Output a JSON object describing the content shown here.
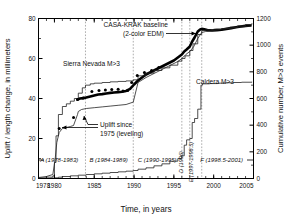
{
  "figure": {
    "xlabel": "Time, in years",
    "ylabel_left": "Uplift / length change, in millimeters",
    "ylabel_right": "Cumulative number, M>3 events"
  },
  "annotations": {
    "casa_krak_line1": "CASA-KRAK baseline",
    "casa_krak_line2": "(2-color EDM)",
    "sierra_nevada": "Sierra Nevada M>3",
    "caldera": "Caldera M>3",
    "uplift_line1": "Uplift since",
    "uplift_line2": "1975 (leveling)"
  },
  "periods": [
    {
      "id": "A",
      "label": "A (1978-1983)",
      "orient": "h",
      "x": 1980.6
    },
    {
      "id": "B",
      "label": "B (1984-1989)",
      "orient": "h",
      "x": 1986.8
    },
    {
      "id": "C",
      "label": "C (1990-1995)",
      "orient": "h",
      "x": 1992.9
    },
    {
      "id": "D",
      "label": "D (1996)",
      "orient": "v",
      "x": 1996.45
    },
    {
      "id": "E",
      "label": "E (1997-1998.5)",
      "orient": "v",
      "x": 1997.6
    },
    {
      "id": "F",
      "label": "F (1998.5-2001)",
      "orient": "h",
      "x": 2001.0
    }
  ],
  "chart_data": {
    "type": "line",
    "title": "",
    "xlabel": "Time, in years",
    "ylabel": "Uplift / length change, in millimeters",
    "ylabel_secondary": "Cumulative number, M>3 events",
    "xlim": [
      1978,
      2005
    ],
    "ylim": [
      0,
      80
    ],
    "ylim_secondary": [
      0,
      1200
    ],
    "xticks": [
      1978,
      1980,
      1985,
      1990,
      1995,
      2000,
      2005
    ],
    "xtick_labels": [
      "1978",
      "1980",
      "1985",
      "1990",
      "1995",
      "2000",
      "2005"
    ],
    "yticks": [
      0,
      20,
      40,
      60,
      80
    ],
    "ytick_labels": [
      "0",
      "20",
      "40",
      "60",
      "80"
    ],
    "yticks_secondary": [
      0,
      200,
      400,
      600,
      800,
      1000,
      1200
    ],
    "ytick_labels_secondary": [
      "0",
      "200",
      "400",
      "600",
      "800",
      "1000",
      "1200"
    ],
    "grid": false,
    "vertical_dashed_lines": [
      1983.9,
      1989.9,
      1996.0,
      1997.0,
      1998.5
    ],
    "legend_position": "inline-annotations",
    "series": [
      {
        "name": "CASA-KRAK baseline (2-color EDM)",
        "axis": "left",
        "style": "thick-black-line",
        "x": [
          1982.9,
          1983.2,
          1983.6,
          1984.0,
          1984.5,
          1985.0,
          1985.5,
          1986.0,
          1986.5,
          1987.0,
          1987.5,
          1988.0,
          1988.5,
          1989.0,
          1989.5,
          1990.0,
          1990.5,
          1991.0,
          1991.5,
          1992.0,
          1992.5,
          1993.0,
          1993.5,
          1994.0,
          1994.5,
          1995.0,
          1995.5,
          1996.0,
          1996.3,
          1996.6,
          1997.0,
          1997.3,
          1997.6,
          1998.0,
          1998.3,
          1998.5,
          1998.8,
          1999.2,
          1999.8,
          2000.4,
          2001.0,
          2001.6,
          2002.2,
          2002.8,
          2003.4,
          2004.0,
          2004.6
        ],
        "y": [
          39.5,
          40.0,
          40.2,
          40.5,
          41.0,
          41.5,
          42.0,
          42.2,
          42.5,
          42.8,
          43.0,
          43.2,
          43.4,
          43.8,
          44.8,
          47.0,
          49.0,
          50.5,
          52.0,
          53.0,
          54.0,
          55.0,
          56.0,
          57.0,
          58.0,
          59.0,
          60.5,
          62.0,
          63.5,
          64.5,
          66.0,
          68.5,
          70.5,
          73.5,
          74.5,
          74.8,
          74.6,
          74.2,
          74.0,
          74.2,
          74.4,
          74.8,
          75.2,
          75.6,
          76.0,
          76.3,
          76.5
        ]
      },
      {
        "name": "Uplift since 1975 (leveling)",
        "axis": "left",
        "style": "thin-black-line",
        "x": [
          1978.0,
          1979.0,
          1979.8,
          1980.1,
          1980.3,
          1980.6,
          1981.0,
          1981.5,
          1982.0,
          1982.4,
          1982.9,
          1983.0,
          1983.4,
          1984.0,
          1985.0,
          1986.0,
          1987.0,
          1988.0,
          1989.0,
          1989.9,
          1990.5,
          1991.5,
          1992.5,
          1993.5,
          1994.5,
          1995.5,
          1996.0,
          1996.5,
          1997.0,
          1997.5,
          1998.0,
          1998.5,
          1999.0,
          2000.0,
          2001.0,
          2002.0,
          2003.0,
          2004.0,
          2004.8
        ],
        "y": [
          0.5,
          1.0,
          2.0,
          10.0,
          18.0,
          23.0,
          25.0,
          25.5,
          26.0,
          26.5,
          32.0,
          33.5,
          34.5,
          35.0,
          35.4,
          35.8,
          36.2,
          36.6,
          37.0,
          38.2,
          48.0,
          50.5,
          52.5,
          54.5,
          56.5,
          58.5,
          60.0,
          62.0,
          63.5,
          66.0,
          70.0,
          73.0,
          73.5,
          74.0,
          74.6,
          75.0,
          75.6,
          76.0,
          76.3
        ]
      },
      {
        "name": "Sierra Nevada M>3",
        "axis": "right",
        "style": "thin-staircase",
        "x": [
          1978.0,
          1979.0,
          1979.8,
          1980.0,
          1980.2,
          1980.5,
          1981.0,
          1981.5,
          1982.0,
          1982.5,
          1983.0,
          1983.5,
          1983.9,
          1984.5,
          1985.0,
          1986.0,
          1987.0,
          1988.0,
          1989.0,
          1989.9,
          1990.5,
          1991.5,
          1992.5,
          1993.5,
          1994.5,
          1995.5,
          1996.0,
          1996.4,
          1997.0,
          1997.4,
          1998.0,
          1998.5,
          1999.0,
          2000.0,
          2001.0,
          2002.0,
          2003.0,
          2004.0,
          2004.8
        ],
        "y": [
          5,
          10,
          20,
          120,
          320,
          480,
          540,
          560,
          580,
          600,
          640,
          680,
          700,
          710,
          715,
          720,
          725,
          728,
          732,
          740,
          770,
          790,
          810,
          830,
          850,
          880,
          900,
          920,
          960,
          1010,
          1080,
          1110,
          1115,
          1120,
          1125,
          1135,
          1145,
          1155,
          1165
        ]
      },
      {
        "name": "Caldera M>3",
        "axis": "right",
        "style": "thin-staircase-low",
        "x": [
          1978.0,
          1979.5,
          1980.0,
          1980.5,
          1981.0,
          1982.0,
          1983.0,
          1984.0,
          1985.0,
          1986.0,
          1987.0,
          1988.0,
          1989.0,
          1989.9,
          1990.5,
          1991.5,
          1992.5,
          1993.5,
          1994.5,
          1995.5,
          1996.0,
          1996.3,
          1996.6,
          1997.0,
          1997.3,
          1997.6,
          1998.0,
          1998.4,
          1998.6,
          1999.5,
          2000.5,
          2001.5,
          2002.5,
          2003.5,
          2004.8
        ],
        "y": [
          0,
          2,
          5,
          10,
          15,
          20,
          25,
          30,
          35,
          40,
          45,
          50,
          55,
          60,
          70,
          80,
          95,
          110,
          130,
          150,
          170,
          250,
          290,
          300,
          420,
          450,
          520,
          700,
          710,
          712,
          715,
          718,
          720,
          722,
          725
        ]
      },
      {
        "name": "Leveling survey points",
        "axis": "left",
        "style": "scatter-dots",
        "x": [
          1980.6,
          1982.4,
          1982.9,
          1983.6,
          1984.7,
          1985.6,
          1986.4,
          1987.2,
          1988.0,
          1988.6,
          1989.2,
          1989.7,
          1990.4,
          1991.3,
          1992.2,
          1993.1
        ],
        "y": [
          25.0,
          30.5,
          39.5,
          40.3,
          43.5,
          44.0,
          44.3,
          44.5,
          44.6,
          43.8,
          44.0,
          48.0,
          51.5,
          53.0,
          54.0,
          55.5
        ]
      }
    ]
  }
}
